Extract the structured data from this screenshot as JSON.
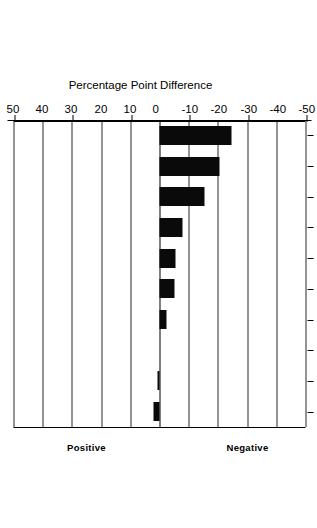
{
  "chart_data": {
    "type": "bar",
    "orientation": "vertical-rotated",
    "title": "",
    "xlabel": "",
    "ylabel": "Percentage Point Difference",
    "ylim": [
      -50,
      50
    ],
    "yticks": [
      -50,
      -40,
      -30,
      -20,
      -10,
      0,
      10,
      20,
      30,
      40,
      50
    ],
    "ytick_labels": [
      "-50",
      "-40",
      "-30",
      "-20",
      "-10",
      "0",
      "10",
      "20",
      "30",
      "40",
      "50"
    ],
    "grid": true,
    "legend": "none",
    "bar_color": "#0a0a0a",
    "categories": [
      "Ethical Corp Bhvr",
      "Culture Actvty Suppt",
      "Industrl Dev Assist",
      "Soc Problem Assist",
      "Even Handed Govt Aff",
      "Child Care Assist",
      "Views Sought by Mgmt",
      "Active EEO",
      "Environmental Protec",
      "Honest Communication"
    ],
    "values": [
      2,
      0.8,
      0,
      -2.5,
      -5,
      -5.5,
      -8,
      -15.5,
      -20.5,
      -24.5
    ],
    "annotations": [
      {
        "text": "Positive",
        "region": "above-zero"
      },
      {
        "text": "Negative",
        "region": "below-zero"
      }
    ]
  },
  "axis": {
    "value_axis_title": "Percentage Point Difference",
    "positive_label": "Positive",
    "negative_label": "Negative"
  }
}
